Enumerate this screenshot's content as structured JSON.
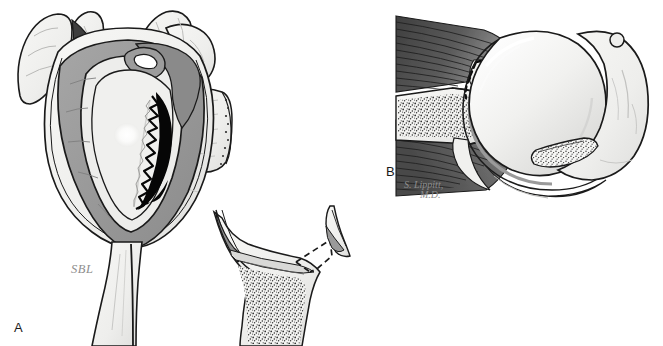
{
  "figure": {
    "background_color": "#ffffff",
    "width": 663,
    "height": 346
  },
  "panels": [
    {
      "id": "A",
      "letter": "A",
      "title": "Glenoid en-face view with anterior-inferior labral and bony defect",
      "annotations": [
        {
          "name": "sbl-label",
          "text": "SBL",
          "color": "#8d8d8d"
        }
      ],
      "structures": [
        "coracoid-process",
        "acromion",
        "glenoid-fossa",
        "glenoid-labrum",
        "biceps-tendon-origin",
        "bankart-lesion",
        "scapular-body",
        "scapular-neck",
        "cross-section-inset",
        "cancellous-bone",
        "detached-bone-fragment"
      ]
    },
    {
      "id": "B",
      "letter": "B",
      "title": "Axial cross-section of glenohumeral joint with Hill-Sachs defect",
      "annotations": [
        {
          "name": "artist-signature-line-1",
          "text": "S. Lippitt,",
          "color": "#8d8d8d"
        },
        {
          "name": "artist-signature-line-2",
          "text": "M.D.",
          "color": "#8d8d8d"
        }
      ],
      "structures": [
        "subscapularis-muscle",
        "infraspinatus-muscle",
        "glenoid-bone",
        "cancellous-bone",
        "anterior-labrum-defect",
        "humeral-head",
        "articular-cartilage",
        "hill-sachs-lesion",
        "greater-tuberosity",
        "joint-capsule"
      ]
    }
  ],
  "palette": {
    "outline": "#1a1a1a",
    "bone_light": "#f2f2f0",
    "bone_shade": "#e2e2e0",
    "cartilage": "#ebebe9",
    "labrum_gray": "#9a9a9a",
    "labrum_gray_dark": "#8a8a8a",
    "muscle_dark": "#4e4e4e",
    "muscle_mid": "#7d7d7d",
    "shadow_dark": "#3a3a3a",
    "defect_black": "#050505",
    "stipple": "#2a2a2a",
    "highlight": "#ffffff",
    "label_gray": "#8d8d8d"
  }
}
